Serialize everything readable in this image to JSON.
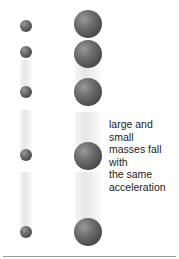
{
  "caption": {
    "line1": "large and small",
    "line2": "masses fall with",
    "line3": "the same",
    "line4": "acceleration"
  },
  "small_mass": {
    "center_x": 26,
    "radius": 6,
    "positions_y": [
      26,
      52,
      92,
      155,
      232
    ]
  },
  "large_mass": {
    "center_x": 88,
    "radius": 14,
    "positions_y": [
      24,
      54,
      92,
      156,
      232
    ]
  },
  "colors": {
    "ball": "#5a5a5a",
    "trail": "#e4e4e4",
    "baseline": "#9a9a9a",
    "text": "#222222"
  }
}
